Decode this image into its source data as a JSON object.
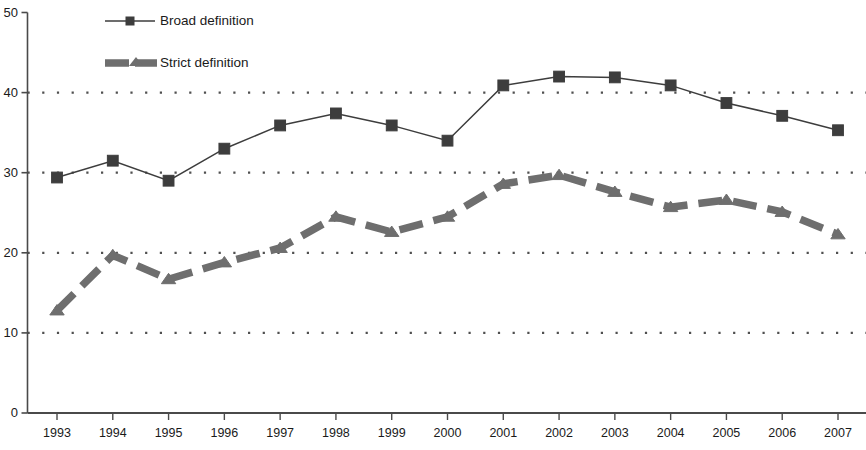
{
  "chart_data": {
    "type": "line",
    "title": "",
    "subtitle": "",
    "xlabel": "",
    "ylabel": "",
    "xlim": [
      1993,
      2007
    ],
    "ylim": [
      0,
      50
    ],
    "yticks": [
      0,
      10,
      20,
      30,
      40,
      50
    ],
    "ytick_labels": [
      "0",
      "10",
      "20",
      "30",
      "40",
      "50"
    ],
    "grid": "horizontal dotted gridlines at 10, 20, 30, 40",
    "legend_position": "top-left inside plot area",
    "categories": [
      1993,
      1994,
      1995,
      1996,
      1997,
      1998,
      1999,
      2000,
      2001,
      2002,
      2003,
      2004,
      2005,
      2006,
      2007
    ],
    "xtick_labels": [
      "1993",
      "1994",
      "1995",
      "1996",
      "1997",
      "1998",
      "1999",
      "2000",
      "2001",
      "2002",
      "2003",
      "2004",
      "2005",
      "2006",
      "2007"
    ],
    "series": [
      {
        "name": "Broad definition",
        "marker": "square",
        "line_style": "solid",
        "color": "#3d3d3d",
        "values": [
          29.4,
          31.5,
          29.0,
          33.0,
          35.9,
          37.4,
          35.9,
          34.0,
          40.9,
          42.0,
          41.9,
          40.9,
          38.7,
          37.1,
          35.3
        ]
      },
      {
        "name": "Strict definition",
        "marker": "triangle",
        "line_style": "dashed",
        "color": "#6e6e6e",
        "values": [
          12.8,
          19.7,
          16.7,
          18.8,
          20.6,
          24.5,
          22.6,
          24.5,
          28.6,
          29.7,
          27.6,
          25.7,
          26.6,
          25.1,
          22.3
        ]
      }
    ]
  },
  "legend": {
    "items": [
      {
        "label": "Broad definition"
      },
      {
        "label": "Strict definition"
      }
    ]
  },
  "colors": {
    "broad": "#3d3d3d",
    "strict": "#6e6e6e",
    "axis": "#4a4a4a",
    "grid": "#4f4f4f",
    "background": "#ffffff"
  }
}
